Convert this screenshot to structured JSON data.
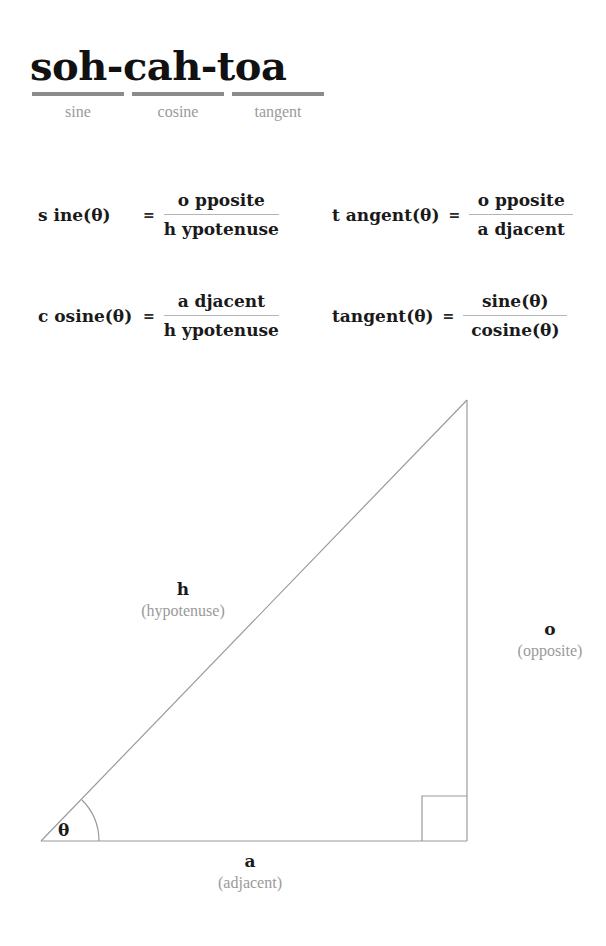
{
  "title_block": {
    "mnemonic": "soh-cah-toa",
    "parts": [
      {
        "label": "sine"
      },
      {
        "label": "cosine"
      },
      {
        "label": "tangent"
      }
    ]
  },
  "formulas": [
    {
      "id": "sine",
      "lhs": "s ine(θ)",
      "equals": "=",
      "numerator": "o pposite",
      "denominator": "h ypotenuse"
    },
    {
      "id": "tangent",
      "lhs": "t angent(θ)",
      "equals": "=",
      "numerator": "o pposite",
      "denominator": "a djacent"
    },
    {
      "id": "cosine",
      "lhs": "c osine(θ)",
      "equals": "=",
      "numerator": "a djacent",
      "denominator": "h ypotenuse"
    },
    {
      "id": "tangent-ratio",
      "lhs": "tangent(θ)",
      "equals": "=",
      "numerator": "sine(θ)",
      "denominator": "cosine(θ)"
    }
  ],
  "diagram": {
    "angle_symbol": "θ",
    "sides": {
      "hypotenuse": {
        "symbol": "h",
        "word": "(hypotenuse)"
      },
      "opposite": {
        "symbol": "o",
        "word": "(opposite)"
      },
      "adjacent": {
        "symbol": "a",
        "word": "(adjacent)"
      }
    }
  },
  "colors": {
    "ink": "#1a1a1a",
    "muted": "#9a9a9a",
    "rule": "#b4b4b4",
    "bar": "#8b8b8b",
    "background": "#ffffff"
  }
}
